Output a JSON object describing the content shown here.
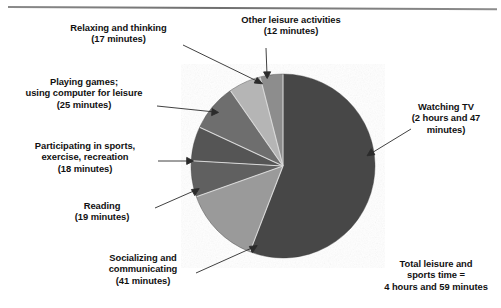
{
  "figure": {
    "background_color": "#ffffff",
    "rule_color": "#7d7d7d"
  },
  "chart_data": {
    "type": "pie",
    "title": "",
    "total_label": "Total leisure and\nsports time =\n4 hours and 59 minutes",
    "total_minutes": 299,
    "units": "minutes",
    "start_angle_deg": 0,
    "direction": "clockwise",
    "center": {
      "x": 283,
      "y": 166
    },
    "radius": 92,
    "legend_position": "callout-labels",
    "grid": false,
    "categories": [
      "Watching TV",
      "Socializing and communicating",
      "Reading",
      "Participating in sports, exercise, recreation",
      "Playing games; using computer for leisure",
      "Relaxing and thinking",
      "Other leisure activities"
    ],
    "values": [
      167,
      41,
      19,
      18,
      25,
      17,
      12
    ],
    "value_labels": [
      "2 hours and 47 minutes",
      "41 minutes",
      "19 minutes",
      "18 minutes",
      "25 minutes",
      "17 minutes",
      "12 minutes"
    ],
    "colors": [
      "#474747",
      "#9a9a9a",
      "#606060",
      "#555555",
      "#6e6e6e",
      "#b5b5b5",
      "#8d8d8d"
    ],
    "slices": [
      {
        "name": "Watching TV",
        "value": 167,
        "color": "#474747"
      },
      {
        "name": "Socializing and communicating",
        "value": 41,
        "color": "#9a9a9a"
      },
      {
        "name": "Reading",
        "value": 19,
        "color": "#606060"
      },
      {
        "name": "Participating in sports, exercise, recreation",
        "value": 18,
        "color": "#555555"
      },
      {
        "name": "Playing games; using computer for leisure",
        "value": 25,
        "color": "#6e6e6e"
      },
      {
        "name": "Relaxing and thinking",
        "value": 17,
        "color": "#b5b5b5"
      },
      {
        "name": "Other leisure activities",
        "value": 12,
        "color": "#8d8d8d"
      }
    ]
  },
  "labels": {
    "relaxing": "Relaxing and thinking\n(17 minutes)",
    "other_leisure": "Other leisure activities\n(12 minutes)",
    "playing_games": "Playing games;\nusing computer for leisure\n(25 minutes)",
    "watching_tv": "Watching TV\n(2 hours and 47\nminutes)",
    "sports": "Participating in sports,\nexercise, recreation\n(18 minutes)",
    "reading": "Reading\n(19 minutes)",
    "socializing": "Socializing and\ncommunicating\n(41 minutes)",
    "total": "Total leisure and\nsports time =\n4 hours and 59 minutes"
  }
}
